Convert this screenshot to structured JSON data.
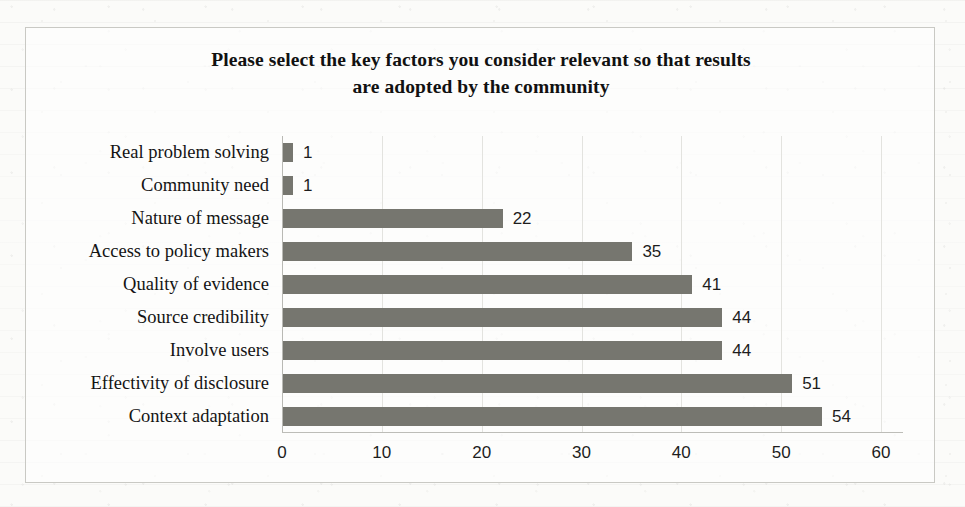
{
  "chart_data": {
    "type": "bar",
    "orientation": "horizontal",
    "title": "Please select the key factors you consider relevant so that results are adopted by the community",
    "title_line1": "Please select the key factors you consider relevant so that results",
    "title_line2": "are adopted by the community",
    "xlabel": "",
    "ylabel": "",
    "categories": [
      "Real problem solving",
      "Community need",
      "Nature of message",
      "Access to policy makers",
      "Quality of evidence",
      "Source credibility",
      "Involve users",
      "Effectivity of disclosure",
      "Context adaptation"
    ],
    "values": [
      1,
      1,
      22,
      35,
      41,
      44,
      44,
      51,
      54
    ],
    "data_labels": [
      "1",
      "1",
      "22",
      "35",
      "41",
      "44",
      "44",
      "51",
      "54"
    ],
    "xlim": [
      0,
      60
    ],
    "xticks": [
      0,
      10,
      20,
      30,
      40,
      50,
      60
    ],
    "xtick_labels": [
      "0",
      "10",
      "20",
      "30",
      "40",
      "50",
      "60"
    ],
    "grid": "vertical",
    "legend": "none",
    "bar_color": "#76766f",
    "gridline_color": "#e3e3df",
    "frame_color": "#c9c9c4",
    "background_color": "#fbfbf9",
    "text_color": "#141414"
  }
}
